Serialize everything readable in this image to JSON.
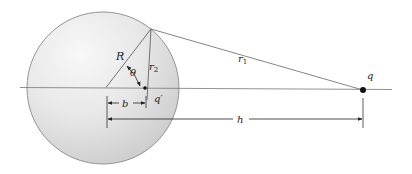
{
  "figure": {
    "colors": {
      "sphere_highlight": "#f7f7f7",
      "sphere_mid": "#e6e6e6",
      "sphere_shadow": "#cccccc",
      "sphere_outline": "#8a8a8a",
      "line": "#777777",
      "dim_line": "#333333",
      "charge": "#111111"
    },
    "labels": {
      "radius": "R",
      "angle": "θ",
      "r2_base": "r",
      "r2_sub": "2",
      "r1_base": "r",
      "r1_sub": "1",
      "charge": "q",
      "image_charge": "q′",
      "image_distance": "b",
      "charge_distance": "h"
    }
  }
}
